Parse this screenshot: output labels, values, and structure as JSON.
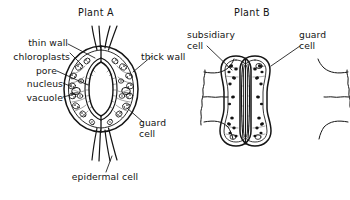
{
  "figure": {
    "kind": "biology-line-diagram",
    "background_color": "#ffffff",
    "ink_color": "#141414"
  },
  "panels": [
    {
      "id": "plant-a",
      "title": "Plant A",
      "stoma_type": "kidney-shaped guard cells",
      "labels": [
        {
          "id": "thin-wall",
          "text": "thin wall",
          "align": "right"
        },
        {
          "id": "chloroplasts",
          "text": "chloroplasts",
          "align": "right"
        },
        {
          "id": "pore",
          "text": "pore",
          "align": "right"
        },
        {
          "id": "nucleus",
          "text": "nucleus",
          "align": "right"
        },
        {
          "id": "vacuole",
          "text": "vacuole",
          "align": "right"
        },
        {
          "id": "thick-wall",
          "text": "thick wall",
          "align": "left"
        },
        {
          "id": "guard-cell",
          "text": "guard\ncell",
          "align": "left"
        },
        {
          "id": "epidermal-cell",
          "text": "epidermal cell",
          "align": "center"
        }
      ]
    },
    {
      "id": "plant-b",
      "title": "Plant B",
      "stoma_type": "dumbbell-shaped guard cells",
      "labels": [
        {
          "id": "subsidiary-cell",
          "text": "subsidiary\ncell",
          "align": "left"
        },
        {
          "id": "guard-cell",
          "text": "guard\ncell",
          "align": "left"
        }
      ]
    }
  ]
}
